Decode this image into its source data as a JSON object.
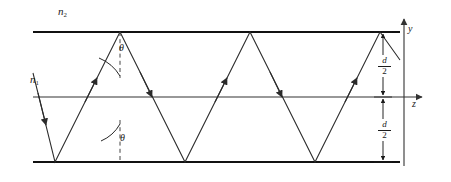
{
  "figure": {
    "type": "ray-optics-waveguide-diagram",
    "labels": {
      "cladding_index": "n",
      "cladding_index_sub": "2",
      "core_index": "n",
      "core_index_sub": "1",
      "angle_top": "θ",
      "angle_bottom": "θ",
      "axis_y": "y",
      "axis_z": "z",
      "half_thickness_num": "d",
      "half_thickness_den": "2"
    },
    "colors": {
      "background": "#ffffff",
      "ink": "#1a1a1a",
      "wall": "#111111",
      "ray": "#2b2b2b",
      "axis": "#333333",
      "dashed": "#444444"
    },
    "geometry": {
      "width": 451,
      "height": 182,
      "top_wall_y": 32,
      "center_axis_y": 97,
      "bottom_wall_y": 162,
      "wall_x_start": 33,
      "wall_x_end": 400,
      "axis_x_end": 428,
      "y_axis_x": 404,
      "y_axis_top": 17,
      "y_axis_bottom": 166,
      "dim_line_x": 383,
      "normal_dashed_x": 120,
      "ray_period": 130,
      "top_bounce_x": [
        120,
        250,
        380
      ],
      "bottom_bounce_x": [
        55,
        185,
        315
      ],
      "ray_start": {
        "x": 33,
        "y": 73
      },
      "ray_end": {
        "x": 400,
        "y": 155
      }
    },
    "annotations": {
      "dimension_label": "d/2",
      "description": "A guided ray zig-zags by total internal reflection between the two core-cladding boundaries of a symmetric slab waveguide of total thickness d. The angle between the ray and the normal to the boundary is theta. Core index n1, cladding index n2."
    }
  }
}
